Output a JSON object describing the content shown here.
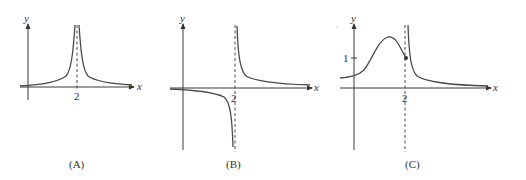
{
  "figure": {
    "panels": [
      {
        "id": "A",
        "caption": "(A)",
        "x_axis_label": "x",
        "y_axis_label": "y",
        "x_tick_label": "2",
        "description": "Both branches rise to +infinity at vertical asymptote x = 2; horizontal asymptote y = 0"
      },
      {
        "id": "B",
        "caption": "(B)",
        "x_axis_label": "x",
        "y_axis_label": "y",
        "x_tick_label": "2",
        "description": "Left branch goes to -infinity, right branch to +infinity at x = 2; horizontal asymptote y = 0"
      },
      {
        "id": "C",
        "caption": "(C)",
        "x_axis_label": "x",
        "y_axis_label": "y",
        "x_tick_label": "2",
        "y_tick_label": "1",
        "description": "Left branch rises to a local max then ends at closed point (2, 1); right branch goes to +infinity at x = 2 and decays to y = 0"
      }
    ]
  },
  "colors": {
    "line": "#4a4a4a",
    "axis": "#3a3a3a",
    "text": "#333333",
    "background": "#ffffff"
  }
}
